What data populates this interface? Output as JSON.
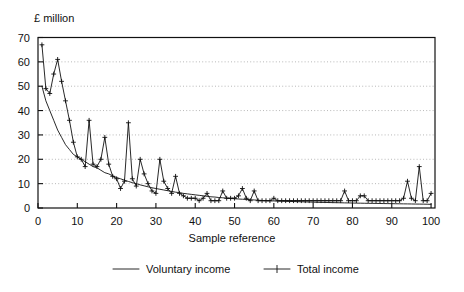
{
  "chart_data": {
    "type": "line",
    "title": "",
    "ylabel": "£ million",
    "xlabel": "Sample reference",
    "ylim": [
      0,
      70
    ],
    "xlim": [
      0,
      101
    ],
    "yticks": [
      0,
      10,
      20,
      30,
      40,
      50,
      60,
      70
    ],
    "xticks": [
      0,
      10,
      20,
      30,
      40,
      50,
      60,
      70,
      80,
      90,
      100
    ],
    "grid": "horizontal-dotted",
    "legend_position": "below",
    "series": [
      {
        "name": "Voluntary income",
        "marker": "none",
        "x": [
          1,
          2,
          3,
          4,
          5,
          6,
          7,
          8,
          9,
          10,
          11,
          12,
          13,
          14,
          15,
          16,
          17,
          18,
          19,
          20,
          21,
          22,
          23,
          24,
          25,
          26,
          27,
          28,
          29,
          30,
          31,
          32,
          33,
          34,
          35,
          36,
          37,
          38,
          39,
          40,
          41,
          42,
          43,
          44,
          45,
          46,
          47,
          48,
          49,
          50,
          51,
          52,
          53,
          54,
          55,
          56,
          57,
          58,
          59,
          60,
          61,
          62,
          63,
          64,
          65,
          66,
          67,
          68,
          69,
          70,
          71,
          72,
          73,
          74,
          75,
          76,
          77,
          78,
          79,
          80,
          81,
          82,
          83,
          84,
          85,
          86,
          87,
          88,
          89,
          90,
          91,
          92,
          93,
          94,
          95,
          96,
          97,
          98,
          99,
          100
        ],
        "values": [
          50,
          44,
          40,
          36,
          32,
          29,
          26,
          24,
          22,
          21,
          20,
          19,
          18,
          17,
          16.5,
          15.5,
          14.5,
          14,
          13.2,
          12.5,
          12,
          11.4,
          10.9,
          10.4,
          10,
          9.5,
          9.1,
          8.7,
          8.3,
          8,
          7.7,
          7.4,
          7.1,
          6.8,
          6.5,
          6.3,
          6,
          5.8,
          5.6,
          5.4,
          5.2,
          5,
          4.8,
          4.6,
          4.5,
          4.3,
          4.2,
          4,
          3.9,
          3.8,
          3.7,
          3.6,
          3.5,
          3.4,
          3.3,
          3.2,
          3.1,
          3,
          2.95,
          2.9,
          2.85,
          2.8,
          2.75,
          2.7,
          2.65,
          2.6,
          2.55,
          2.5,
          2.45,
          2.4,
          2.35,
          2.3,
          2.28,
          2.25,
          2.2,
          2.18,
          2.15,
          2.1,
          2.08,
          2.05,
          2.0,
          1.98,
          1.95,
          1.92,
          1.9,
          1.88,
          1.85,
          1.82,
          1.8,
          1.78,
          1.75,
          1.72,
          1.7,
          1.68,
          1.65,
          1.62,
          1.6,
          1.58,
          1.55,
          1.5
        ]
      },
      {
        "name": "Total income",
        "marker": "plus",
        "x": [
          1,
          2,
          3,
          4,
          5,
          6,
          7,
          8,
          9,
          10,
          11,
          12,
          13,
          14,
          15,
          16,
          17,
          18,
          19,
          20,
          21,
          22,
          23,
          24,
          25,
          26,
          27,
          28,
          29,
          30,
          31,
          32,
          33,
          34,
          35,
          36,
          37,
          38,
          39,
          40,
          41,
          42,
          43,
          44,
          45,
          46,
          47,
          48,
          49,
          50,
          51,
          52,
          53,
          54,
          55,
          56,
          57,
          58,
          59,
          60,
          61,
          62,
          63,
          64,
          65,
          66,
          67,
          68,
          69,
          70,
          71,
          72,
          73,
          74,
          75,
          76,
          77,
          78,
          79,
          80,
          81,
          82,
          83,
          84,
          85,
          86,
          87,
          88,
          89,
          90,
          91,
          92,
          93,
          94,
          95,
          96,
          97,
          98,
          99,
          100
        ],
        "values": [
          67,
          49,
          47,
          55,
          61,
          52,
          44,
          36,
          27,
          21,
          20,
          17,
          36,
          18,
          17,
          20,
          29,
          18,
          13,
          12,
          8,
          11,
          35,
          12,
          9,
          20,
          14,
          10,
          7,
          6,
          20,
          11,
          8,
          6,
          13,
          6,
          5,
          4,
          4,
          4,
          3,
          4,
          6,
          3,
          3,
          3,
          7,
          4,
          4,
          4,
          5,
          8,
          4,
          3,
          7,
          3,
          3,
          3,
          3,
          4,
          3,
          3,
          3,
          3,
          3,
          3,
          3,
          3,
          3,
          3,
          3,
          3,
          3,
          3,
          3,
          3,
          3,
          7,
          3,
          3,
          3,
          5,
          5,
          3,
          3,
          3,
          3,
          3,
          3,
          3,
          3,
          3,
          4,
          11,
          4,
          3,
          17,
          3,
          3,
          6
        ]
      }
    ]
  },
  "legend": {
    "items": [
      {
        "label": "Voluntary income",
        "marker": "line"
      },
      {
        "label": "Total income",
        "marker": "line-plus"
      }
    ]
  }
}
